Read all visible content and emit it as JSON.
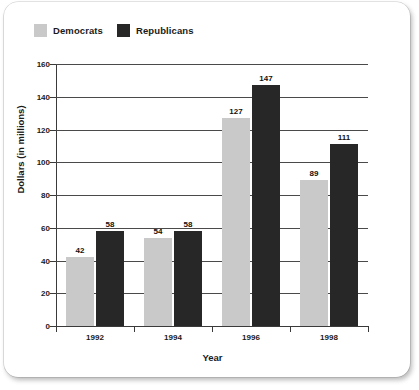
{
  "chart_data": {
    "type": "bar",
    "title": "",
    "categories": [
      "1992",
      "1994",
      "1996",
      "1998"
    ],
    "series": [
      {
        "name": "Democrats",
        "color": "#c9c9c9",
        "values": [
          42,
          54,
          127,
          89
        ]
      },
      {
        "name": "Republicans",
        "color": "#272727",
        "values": [
          58,
          58,
          147,
          111
        ]
      }
    ],
    "xlabel": "Year",
    "ylabel": "Dollars (in millions)",
    "ylim": [
      0,
      160
    ],
    "ytick_labels": [
      "0",
      "20",
      "40",
      "60",
      "80",
      "100",
      "120",
      "140",
      "160"
    ],
    "ytick_values": [
      0,
      20,
      40,
      60,
      80,
      100,
      120,
      140,
      160
    ],
    "grid": true,
    "legend_position": "top-left"
  },
  "legend": {
    "entries": [
      {
        "label": "Democrats"
      },
      {
        "label": "Republicans"
      }
    ]
  }
}
